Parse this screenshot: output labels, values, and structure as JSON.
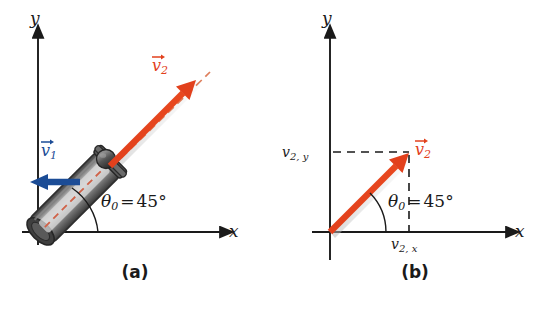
{
  "figure": {
    "background_color": "#ffffff"
  },
  "colors": {
    "vector_red": "#E2401C",
    "vector_blue": "#1B4C96",
    "axis_black": "#1a1a1a",
    "tube_dark": "#4a4a4a",
    "tube_light": "#c9c9c9",
    "ball_dark": "#3a3a3a",
    "dashed_red": "#D9683F"
  },
  "panel_a": {
    "caption": "(a)",
    "x_axis_label": "x",
    "y_axis_label": "y",
    "angle_symbol": "θ",
    "angle_subscript": "0",
    "angle_equals": "=",
    "angle_value": "45°",
    "vector_v1": {
      "symbol": "v",
      "subscript": "1",
      "color": "#1B4C96",
      "direction": "left"
    },
    "vector_v2": {
      "symbol": "v",
      "subscript": "2",
      "color": "#E2401C",
      "direction": "45-degrees-up-right"
    },
    "object": "cannon-tube",
    "projectile": "ball"
  },
  "panel_b": {
    "caption": "(b)",
    "x_axis_label": "x",
    "y_axis_label": "y",
    "angle_symbol": "θ",
    "angle_subscript": "0",
    "angle_equals": "=",
    "angle_value": "45°",
    "vector_v2": {
      "symbol": "v",
      "subscript": "2",
      "color": "#E2401C",
      "direction": "45-degrees-up-right"
    },
    "component_y": {
      "symbol": "v",
      "subscript": "2, y"
    },
    "component_x": {
      "symbol": "v",
      "subscript": "2, x"
    }
  }
}
